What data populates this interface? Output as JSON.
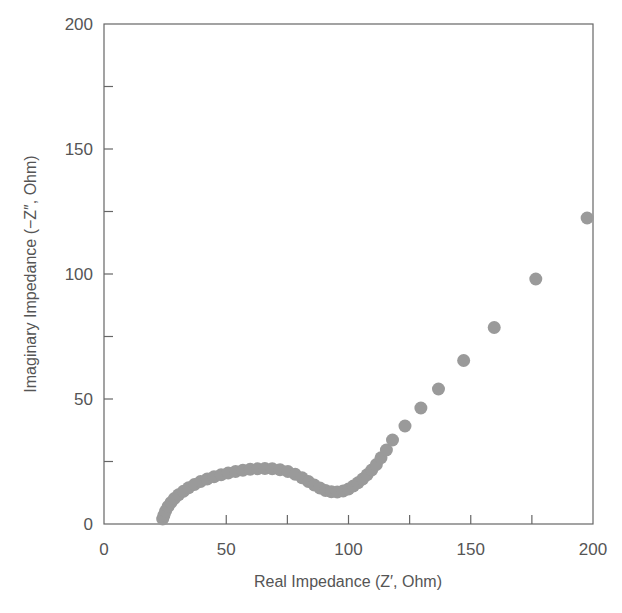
{
  "chart_data": {
    "type": "scatter",
    "title": "",
    "xlabel": "Real Impedance (Z′, Ohm)",
    "ylabel": "Imaginary Impedance (−Z″, Ohm)",
    "xlim": [
      0,
      200
    ],
    "ylim": [
      0,
      200
    ],
    "xticks": [
      0,
      50,
      100,
      150,
      200
    ],
    "yticks": [
      0,
      50,
      100,
      150,
      200
    ],
    "minor_tick_step": 25,
    "grid": false,
    "legend": null,
    "marker_color": "#9a9a9a",
    "series": [
      {
        "name": "Nyquist",
        "points": [
          [
            24.0,
            2.0
          ],
          [
            24.5,
            3.5
          ],
          [
            25.2,
            5.2
          ],
          [
            26.2,
            7.0
          ],
          [
            27.4,
            8.6
          ],
          [
            28.8,
            10.2
          ],
          [
            30.5,
            11.7
          ],
          [
            32.5,
            13.1
          ],
          [
            34.6,
            14.5
          ],
          [
            37.0,
            15.8
          ],
          [
            39.5,
            17.0
          ],
          [
            42.2,
            18.0
          ],
          [
            45.0,
            18.9
          ],
          [
            47.9,
            19.7
          ],
          [
            50.8,
            20.4
          ],
          [
            53.8,
            21.0
          ],
          [
            56.8,
            21.5
          ],
          [
            59.8,
            21.9
          ],
          [
            62.8,
            22.1
          ],
          [
            65.8,
            22.2
          ],
          [
            68.8,
            22.1
          ],
          [
            72.0,
            21.7
          ],
          [
            75.2,
            21.0
          ],
          [
            78.2,
            19.9
          ],
          [
            81.0,
            18.5
          ],
          [
            83.6,
            17.0
          ],
          [
            86.0,
            15.6
          ],
          [
            88.3,
            14.4
          ],
          [
            90.6,
            13.4
          ],
          [
            93.0,
            12.9
          ],
          [
            95.4,
            12.8
          ],
          [
            97.8,
            13.2
          ],
          [
            100.0,
            14.0
          ],
          [
            102.0,
            15.2
          ],
          [
            103.9,
            16.5
          ],
          [
            105.8,
            18.0
          ],
          [
            107.6,
            19.7
          ],
          [
            109.5,
            21.6
          ],
          [
            111.4,
            23.8
          ],
          [
            113.3,
            26.5
          ],
          [
            115.5,
            29.6
          ],
          [
            118.0,
            33.6
          ],
          [
            123.1,
            39.2
          ],
          [
            129.6,
            46.4
          ],
          [
            136.8,
            54.0
          ],
          [
            147.1,
            65.4
          ],
          [
            159.6,
            78.6
          ],
          [
            176.6,
            98.0
          ],
          [
            197.6,
            122.4
          ]
        ]
      }
    ]
  }
}
